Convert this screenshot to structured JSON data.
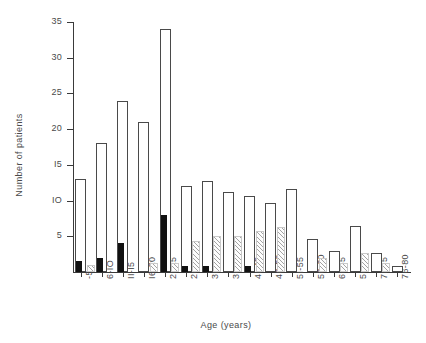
{
  "chart_data": {
    "type": "bar",
    "title": "",
    "xlabel": "Age (years)",
    "ylabel": "Number of patients",
    "ylim": [
      0,
      35
    ],
    "yticks": [
      0,
      5,
      10,
      15,
      20,
      25,
      30,
      35
    ],
    "ytick_labels": [
      "",
      "5",
      "IO",
      "I5",
      "20",
      "25",
      "30",
      "35"
    ],
    "grid": false,
    "legend": "none",
    "categories": [
      "-5",
      "6-IO",
      "II-I5",
      "I6-20",
      "2I-25",
      "26-30",
      "3I-35",
      "36-40",
      "4I-45",
      "46-50",
      "5I-55",
      "56-60",
      "6I-65",
      "56-70",
      "7I-75",
      "76-80"
    ],
    "series": [
      {
        "name": "total",
        "style": "open",
        "values": [
          13,
          18,
          24,
          21,
          34,
          12,
          12.7,
          11.2,
          10.6,
          9.7,
          11.6,
          4.6,
          2.9,
          6.5,
          2.7,
          0.8
        ]
      },
      {
        "name": "subgroup-solid",
        "style": "black",
        "values": [
          1.5,
          2.0,
          4.0,
          0,
          8.0,
          0.8,
          0.9,
          0,
          0.9,
          0,
          0,
          0,
          0,
          0,
          0,
          0
        ]
      },
      {
        "name": "subgroup-hatched",
        "style": "hatched",
        "values": [
          1.0,
          0,
          0,
          1.2,
          1.3,
          4.4,
          5.0,
          5.0,
          5.7,
          6.3,
          0,
          1.9,
          1.3,
          2.6,
          1.3,
          0
        ]
      }
    ]
  },
  "axis": {
    "y_title": "Number of patients",
    "x_title": "Age (years)"
  }
}
